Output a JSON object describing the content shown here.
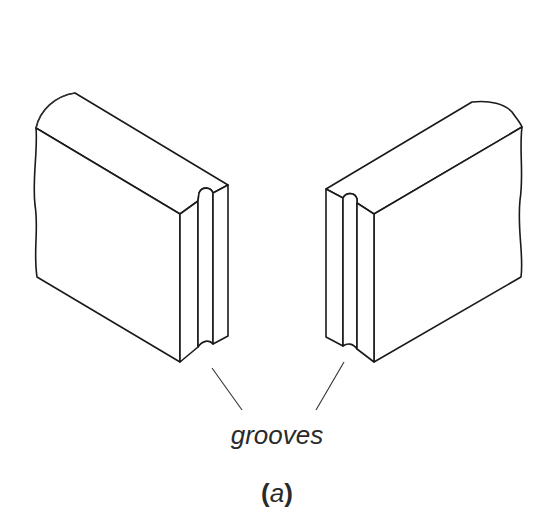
{
  "figure": {
    "label": "grooves",
    "caption_open": "(",
    "caption_letter": "a",
    "caption_close": ")"
  },
  "parts": {
    "left_block": "panel with grooved edge (left)",
    "right_block": "panel with grooved edge (right)"
  },
  "colors": {
    "line": "#1a1a1a",
    "background": "#ffffff",
    "text": "#2a2a2a"
  }
}
